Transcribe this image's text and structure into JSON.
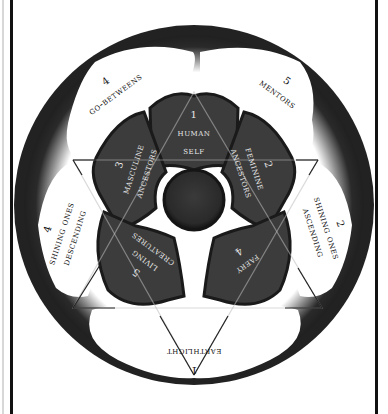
{
  "diagram": {
    "type": "rose-wheel",
    "colors": {
      "background": "#ffffff",
      "ring": "#2a2a2a",
      "petal": "#3c3c3c",
      "hub": "#2e2e2e",
      "outer_label": "#111111",
      "inner_label": "#e8e8e8",
      "triangle_lines": "#222222"
    },
    "inner_petals": [
      {
        "number": "1",
        "line1": "human",
        "line2": "self"
      },
      {
        "number": "2",
        "line1": "feminine",
        "line2": "ancestors"
      },
      {
        "number": "3",
        "line1": "masculine",
        "line2": "ancestors"
      },
      {
        "number": "4",
        "line1": "faery",
        "line2": ""
      },
      {
        "number": "5",
        "line1": "living",
        "line2": "creatures"
      }
    ],
    "outer_regions": [
      {
        "number": "1",
        "line1": "earthlight",
        "line2": ""
      },
      {
        "number": "2",
        "line1": "shining ones",
        "line2": "ascending"
      },
      {
        "number": "4",
        "line1": "shining ones",
        "line2": "descending"
      },
      {
        "number": "4",
        "line1": "go-betweens",
        "line2": ""
      },
      {
        "number": "5",
        "line1": "mentors",
        "line2": ""
      }
    ]
  }
}
